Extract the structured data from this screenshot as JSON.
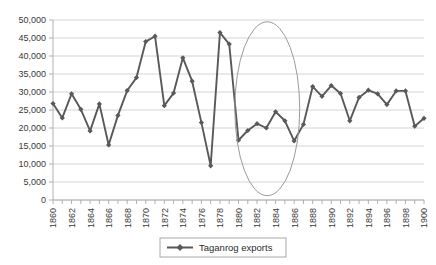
{
  "chart_data": {
    "type": "line",
    "title": "",
    "subtitle": "",
    "xlabel": "",
    "ylabel": "",
    "grid": true,
    "grid_axis": "y",
    "legend_position": "bottom",
    "xlim": [
      1860,
      1900
    ],
    "ylim": [
      0,
      50000
    ],
    "ytick_step": 5000,
    "xtick_step": 1,
    "xtick_label_step": 2,
    "xtick_label_rotation": -90,
    "ytick_labels": [
      "0",
      "5,000",
      "10,000",
      "15,000",
      "20,000",
      "25,000",
      "30,000",
      "35,000",
      "40,000",
      "45,000",
      "50,000"
    ],
    "ytick_values": [
      0,
      5000,
      10000,
      15000,
      20000,
      25000,
      30000,
      35000,
      40000,
      45000,
      50000
    ],
    "xtick_labels": [
      "1860",
      "1862",
      "1864",
      "1866",
      "1868",
      "1870",
      "1872",
      "1874",
      "1876",
      "1878",
      "1880",
      "1882",
      "1884",
      "1886",
      "1888",
      "1890",
      "1892",
      "1894",
      "1896",
      "1898",
      "1900"
    ],
    "xtick_values": [
      1860,
      1862,
      1864,
      1866,
      1868,
      1870,
      1872,
      1874,
      1876,
      1878,
      1880,
      1882,
      1884,
      1886,
      1888,
      1890,
      1892,
      1894,
      1896,
      1898,
      1900
    ],
    "series": [
      {
        "name": "Taganrog exports",
        "color": "#595959",
        "marker": "diamond",
        "x": [
          1860,
          1861,
          1862,
          1863,
          1864,
          1865,
          1866,
          1867,
          1868,
          1869,
          1870,
          1871,
          1872,
          1873,
          1874,
          1875,
          1876,
          1877,
          1878,
          1879,
          1880,
          1881,
          1882,
          1883,
          1884,
          1885,
          1886,
          1887,
          1888,
          1889,
          1890,
          1891,
          1892,
          1893,
          1894,
          1895,
          1896,
          1897,
          1898,
          1899,
          1900
        ],
        "values": [
          26800,
          22800,
          29500,
          25200,
          19200,
          26700,
          15300,
          23500,
          30400,
          34000,
          44000,
          45500,
          26200,
          29700,
          39500,
          33000,
          21500,
          9500,
          46500,
          43300,
          16600,
          19300,
          21200,
          20000,
          24500,
          22000,
          16400,
          21000,
          31500,
          28800,
          31800,
          29600,
          22000,
          28500,
          30500,
          29500,
          26500,
          30300,
          30300,
          20500,
          22700
        ]
      }
    ],
    "annotations": [
      {
        "type": "ellipse",
        "name": "highlight-ellipse",
        "x_range": [
          1879.6,
          1886.6
        ],
        "y_range": [
          1200,
          49500
        ],
        "stroke": "#9a9a9a"
      }
    ]
  },
  "legend": {
    "entries": [
      {
        "label": "Taganrog exports",
        "color": "#595959"
      }
    ]
  },
  "colors": {
    "series": "#595959",
    "grid": "#d4d4d4",
    "axis": "#b0b0b0",
    "text": "#3a3a3a",
    "ellipse": "#9a9a9a",
    "legend_border": "#a8a8a8",
    "background": "#ffffff"
  }
}
